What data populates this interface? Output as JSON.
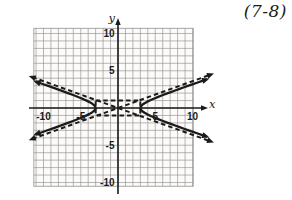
{
  "figure_label": "(7-8)",
  "colors": {
    "ink": "#1b1b1b",
    "grid_line": "#929292",
    "paper": "#fcfbf9"
  },
  "axes": {
    "x_letter": "x",
    "y_letter": "y",
    "x_tick_labels": [
      "-10",
      "-5",
      "5",
      "10"
    ],
    "x_tick_values": [
      -10,
      -5,
      5,
      10
    ],
    "y_tick_labels": [
      "10",
      "5",
      "-5",
      "-10"
    ],
    "y_tick_values": [
      10,
      5,
      -5,
      -10
    ]
  },
  "chart_data": {
    "type": "line",
    "title": "",
    "xlabel": "x",
    "ylabel": "y",
    "xlim": [
      -11.3,
      10.1
    ],
    "ylim": [
      -10.5,
      10.7
    ],
    "grid": true,
    "grid_step": 1,
    "x_ticks_labeled": [
      -10,
      -5,
      5,
      10
    ],
    "y_ticks_labeled": [
      10,
      5,
      -5,
      -10
    ],
    "series": [
      {
        "name": "hyperbola",
        "style": "solid",
        "equation": "x^2/9 - y^2 = 1",
        "a": 3,
        "b": 1,
        "opens": "left-right",
        "vertices": [
          [
            -3,
            0
          ],
          [
            3,
            0
          ]
        ],
        "end_arrows": true
      },
      {
        "name": "asymptotes",
        "style": "dashed",
        "equations": [
          "y = x/3",
          "y = -x/3"
        ],
        "through": [
          0,
          0
        ],
        "end_arrows": true
      },
      {
        "name": "central-box",
        "style": "dashed",
        "rect_x": [
          -3,
          3
        ],
        "rect_y": [
          -1,
          1
        ]
      }
    ]
  }
}
